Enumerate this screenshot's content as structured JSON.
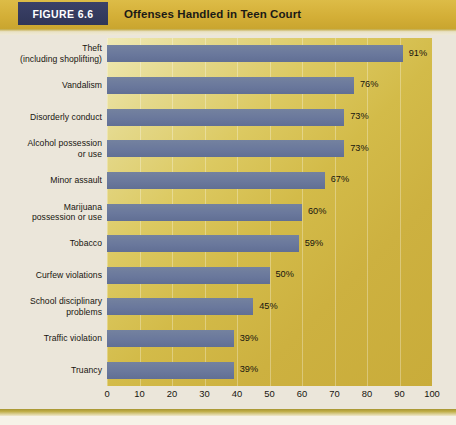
{
  "figure": {
    "tag_label": "FIGURE 6.6",
    "title": "Offenses Handled in Teen Court"
  },
  "colors": {
    "tag_background": "#33395e",
    "header_band": "#d8b63f",
    "bar_fill": "#6e7c9f",
    "plot_background_light": "#efe9b4",
    "plot_background_dark": "#c9ac3a",
    "page_background": "#ebe6da",
    "text": "#17150f"
  },
  "chart_data": {
    "type": "bar",
    "orientation": "horizontal",
    "title": "Offenses Handled in Teen Court",
    "xlabel": "",
    "ylabel": "",
    "xlim": [
      0,
      100
    ],
    "xticks": [
      0,
      10,
      20,
      30,
      40,
      50,
      60,
      70,
      80,
      90,
      100
    ],
    "xtick_labels": [
      "0",
      "10",
      "20",
      "30",
      "40",
      "50",
      "60",
      "70",
      "80",
      "90",
      "100"
    ],
    "grid": "vertical",
    "legend": "none",
    "value_suffix": "%",
    "categories": [
      "Theft (including shoplifting)",
      "Vandalism",
      "Disorderly conduct",
      "Alcohol possession or use",
      "Minor assault",
      "Marijuana possession or use",
      "Tobacco",
      "Curfew violations",
      "School disciplinary problems",
      "Traffic violation",
      "Truancy"
    ],
    "values": [
      91,
      76,
      73,
      73,
      67,
      60,
      59,
      50,
      45,
      39,
      39
    ],
    "data_labels": [
      "91%",
      "76%",
      "73%",
      "73%",
      "67%",
      "60%",
      "59%",
      "50%",
      "45%",
      "39%",
      "39%"
    ],
    "rows": [
      {
        "line1": "Theft",
        "line2": "(including shoplifting)",
        "value": 91,
        "label": "91%"
      },
      {
        "line1": "Vandalism",
        "line2": "",
        "value": 76,
        "label": "76%"
      },
      {
        "line1": "Disorderly conduct",
        "line2": "",
        "value": 73,
        "label": "73%"
      },
      {
        "line1": "Alcohol possession",
        "line2": "or use",
        "value": 73,
        "label": "73%"
      },
      {
        "line1": "Minor assault",
        "line2": "",
        "value": 67,
        "label": "67%"
      },
      {
        "line1": "Marijuana",
        "line2": "possession or use",
        "value": 60,
        "label": "60%"
      },
      {
        "line1": "Tobacco",
        "line2": "",
        "value": 59,
        "label": "59%"
      },
      {
        "line1": "Curfew violations",
        "line2": "",
        "value": 50,
        "label": "50%"
      },
      {
        "line1": "School disciplinary",
        "line2": "problems",
        "value": 45,
        "label": "45%"
      },
      {
        "line1": "Traffic violation",
        "line2": "",
        "value": 39,
        "label": "39%"
      },
      {
        "line1": "Truancy",
        "line2": "",
        "value": 39,
        "label": "39%"
      }
    ]
  }
}
